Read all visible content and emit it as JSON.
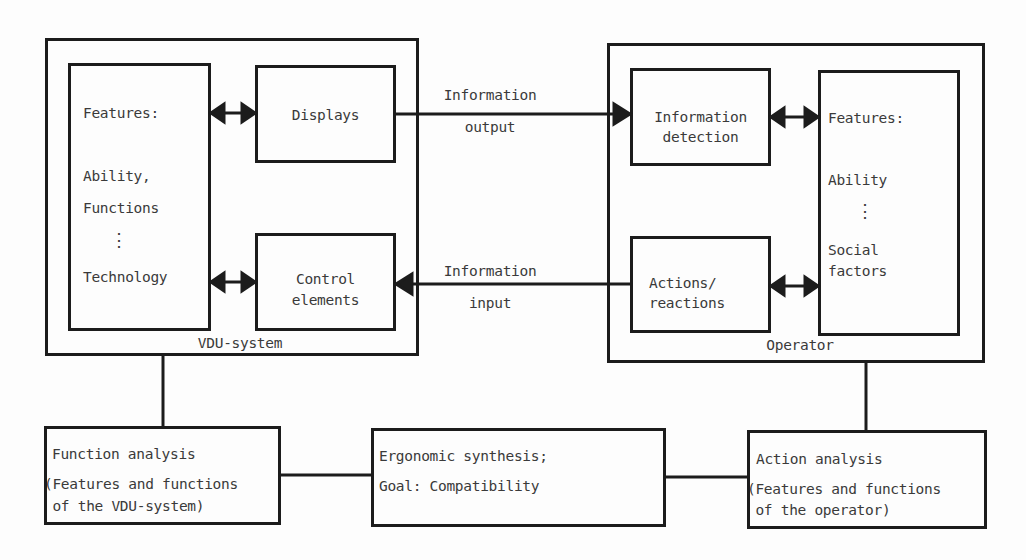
{
  "vdu_system": {
    "label": "VDU-system",
    "features_box": {
      "heading": "Features:",
      "items": [
        "Ability,",
        "Functions",
        "⋮",
        "Technology"
      ]
    },
    "displays": "Displays",
    "control_elements": [
      "Control",
      "elements"
    ]
  },
  "operator": {
    "label": "Operator",
    "information_detection": [
      "Information",
      "detection"
    ],
    "actions_reactions": [
      "Actions/",
      "reactions"
    ],
    "features_box": {
      "heading": "Features:",
      "items": [
        "Ability",
        "⋮",
        "Social",
        "factors"
      ]
    }
  },
  "flows": {
    "output": [
      "Information",
      "output"
    ],
    "input": [
      "Information",
      "input"
    ]
  },
  "bottom": {
    "function_analysis": {
      "title": "Function analysis",
      "desc": [
        "(Features and functions",
        " of the VDU-system)"
      ]
    },
    "ergonomic_synthesis": {
      "title": "Ergonomic synthesis;",
      "goal": "Goal: Compatibility"
    },
    "action_analysis": {
      "title": "Action analysis",
      "desc": [
        "(Features and functions",
        " of the operator)"
      ]
    }
  }
}
